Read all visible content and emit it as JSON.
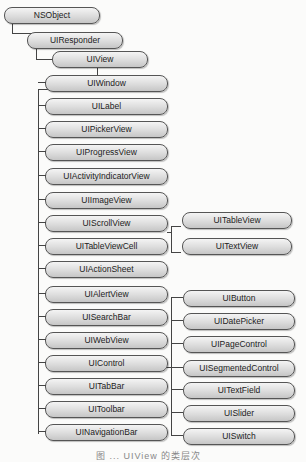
{
  "diagram": {
    "root": "NSObject",
    "level1": "UIResponder",
    "level2": "UIView",
    "uiview_children": [
      "UIWindow",
      "UILabel",
      "UIPickerView",
      "UIProgressView",
      "UIActivityIndicatorView",
      "UIImageView",
      "UIScrollView",
      "UITableViewCell",
      "UIActionSheet",
      "UIAlertView",
      "UISearchBar",
      "UIWebView",
      "UIControl",
      "UITabBar",
      "UIToolbar",
      "UINavigationBar"
    ],
    "uiscrollview_children": [
      "UITableView",
      "UITextView"
    ],
    "uicontrol_children": [
      "UIButton",
      "UIDatePicker",
      "UIPageControl",
      "UISegmentedControl",
      "UITextField",
      "UISlider",
      "UISwitch"
    ],
    "caption": "图 ... UIView 的类层次"
  }
}
